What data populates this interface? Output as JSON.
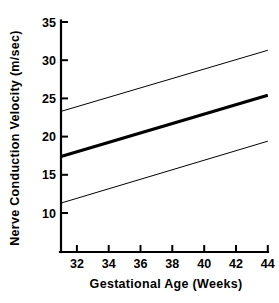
{
  "chart_data": {
    "type": "line",
    "title": "",
    "xlabel": "Gestational Age (Weeks)",
    "ylabel": "Nerve Conduction Velocity (m/sec)",
    "xlim": [
      31,
      44
    ],
    "ylim": [
      7.5,
      35
    ],
    "xticks": [
      32,
      34,
      36,
      38,
      40,
      42,
      44
    ],
    "yticks": [
      10,
      15,
      20,
      25,
      30,
      35
    ],
    "xtick_labels": [
      "32",
      "34",
      "36",
      "38",
      "40",
      "42",
      "44"
    ],
    "ytick_labels": [
      "10",
      "15",
      "20",
      "25",
      "30",
      "35"
    ],
    "grid": false,
    "legend": "none",
    "x": [
      31,
      44
    ],
    "series": [
      {
        "name": "upper-confidence-bound",
        "style": "thin",
        "values": [
          23.3,
          31.3
        ]
      },
      {
        "name": "mean-regression",
        "style": "thick",
        "values": [
          17.4,
          25.4
        ]
      },
      {
        "name": "lower-confidence-bound",
        "style": "thin",
        "values": [
          11.3,
          19.4
        ]
      }
    ],
    "colors": {
      "axis": "#000000",
      "mean_line": "#000000",
      "bound_line": "#000000",
      "background": "#ffffff"
    }
  }
}
